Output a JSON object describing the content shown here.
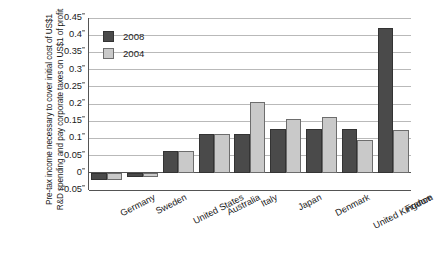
{
  "chart_data": {
    "type": "bar",
    "title": "",
    "subtitle": "",
    "xlabel": "",
    "ylabel": "Pre-tax income necessary to cover initial cost of US$1 R&D spending and pay corporate taxes on US$1 of profit",
    "categories": [
      "Germany",
      "Sweden",
      "United States",
      "Australia",
      "Italy",
      "Japan",
      "Denmark",
      "United Kingdom",
      "France"
    ],
    "series": [
      {
        "name": "2008",
        "color": "#4a4a4a",
        "values": [
          -0.02,
          -0.013,
          0.062,
          0.113,
          0.113,
          0.128,
          0.128,
          0.128,
          0.42
        ]
      },
      {
        "name": "2004",
        "color": "#c9c9c9",
        "values": [
          -0.022,
          -0.012,
          0.062,
          0.113,
          0.205,
          0.155,
          0.163,
          0.095,
          0.125
        ]
      }
    ],
    "ylim": [
      -0.05,
      0.45
    ],
    "ytick_values": [
      -0.05,
      0,
      0.05,
      0.1,
      0.15,
      0.2,
      0.25,
      0.3,
      0.35,
      0.4,
      0.45
    ],
    "ytick_labels": [
      "–0.05",
      "0",
      "0.05",
      "0.1",
      "0.15",
      "0.2",
      "0.25",
      "0.3",
      "0.35",
      "0.4",
      "0.45"
    ],
    "grid": true,
    "grid_axis": "y",
    "legend_position": "top-left-inside",
    "legend_entries": [
      "2008",
      "2004"
    ],
    "xtick_rotation": -27
  },
  "legend": {
    "items": [
      {
        "label": "2008"
      },
      {
        "label": "2004"
      }
    ]
  },
  "axis": {
    "y_title": "Pre-tax income necessary to cover initial cost of US$1 R&D spending and pay corporate taxes on US$1 of profit"
  }
}
